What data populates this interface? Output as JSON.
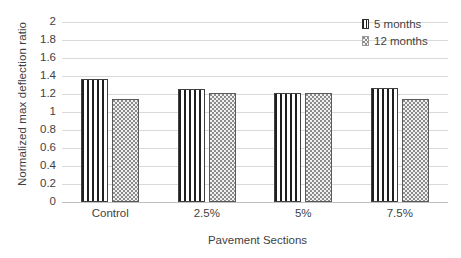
{
  "chart_data": {
    "type": "bar",
    "title": "",
    "xlabel": "Pavement Sections",
    "ylabel": "Normalized max deflection ratio",
    "categories": [
      "Control",
      "2.5%",
      "5%",
      "7.5%"
    ],
    "series": [
      {
        "name": "5 months",
        "values": [
          1.37,
          1.26,
          1.21,
          1.27
        ]
      },
      {
        "name": "12 months",
        "values": [
          1.15,
          1.21,
          1.21,
          1.14
        ]
      }
    ],
    "ylim": [
      0,
      2
    ],
    "ytick_step": 0.2,
    "yticks": [
      "2",
      "1.8",
      "1.6",
      "1.4",
      "1.2",
      "1",
      "0.8",
      "0.6",
      "0.4",
      "0.2",
      "0"
    ],
    "ytick_values": [
      2,
      1.8,
      1.6,
      1.4,
      1.2,
      1,
      0.8,
      0.6,
      0.4,
      0.2,
      0
    ],
    "grid": "horizontal",
    "legend_position": "top-right",
    "series_patterns": [
      "vertical-stripes",
      "dotted-stipple"
    ],
    "colors": {
      "background": "#ffffff",
      "gridline": "#d9d9d9",
      "axis": "#bfbfbf",
      "text": "#3f3f3f",
      "series_0_fill": "#1f1f1f",
      "series_1_fill": "#8c8c8c"
    }
  }
}
